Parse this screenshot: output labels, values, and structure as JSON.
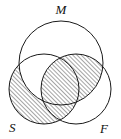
{
  "figure": {
    "kind": "venn-diagram",
    "sets_count": 3,
    "width": 121,
    "height": 139,
    "background_color": "#ffffff",
    "stroke_color": "#1a1a1a",
    "hatch_color": "#2b2b2b"
  },
  "labels": {
    "top": "M",
    "bottom_left": "S",
    "bottom_right": "F"
  },
  "circles": [
    {
      "id": "M",
      "label": "M",
      "cx": 61,
      "cy": 63,
      "r": 42
    },
    {
      "id": "S",
      "label": "S",
      "cx": 44,
      "cy": 89,
      "r": 35
    },
    {
      "id": "F",
      "label": "F",
      "cx": 76,
      "cy": 89,
      "r": 35
    }
  ],
  "label_positions": [
    {
      "id": "M",
      "x": 61,
      "y": 14,
      "anchor": "middle"
    },
    {
      "id": "S",
      "x": 9,
      "y": 132,
      "anchor": "start"
    },
    {
      "id": "F",
      "x": 100,
      "y": 133,
      "anchor": "start"
    }
  ],
  "regions": [
    {
      "id": "M-only",
      "expression": "M only",
      "shaded": false
    },
    {
      "id": "S-only",
      "expression": "S only",
      "shaded": true
    },
    {
      "id": "F-only",
      "expression": "F only",
      "shaded": false
    },
    {
      "id": "SM",
      "expression": "S and M",
      "shaded": false
    },
    {
      "id": "MF",
      "expression": "M and F",
      "shaded": true
    },
    {
      "id": "SF",
      "expression": "S and F",
      "shaded": true
    },
    {
      "id": "SMF",
      "expression": "S, M and F",
      "shaded": true
    }
  ],
  "hatch": {
    "style": "diagonal-lines",
    "direction": "lower-left-to-upper-right",
    "angle_degrees": 45,
    "spacing_px": 3,
    "line_width_px": 0.8
  }
}
